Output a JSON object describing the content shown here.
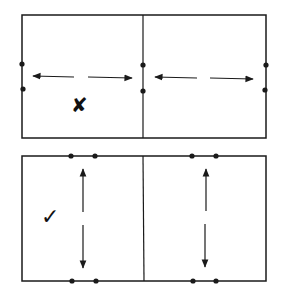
{
  "diagram": {
    "colors": {
      "stroke": "#1a1a1a",
      "background": "#ffffff"
    },
    "panels": [
      {
        "id": "top",
        "verdict": "incorrect",
        "verdict_symbol": "✘",
        "arrow_direction": "horizontal"
      },
      {
        "id": "bottom",
        "verdict": "correct",
        "verdict_symbol": "✓",
        "arrow_direction": "vertical"
      }
    ]
  }
}
